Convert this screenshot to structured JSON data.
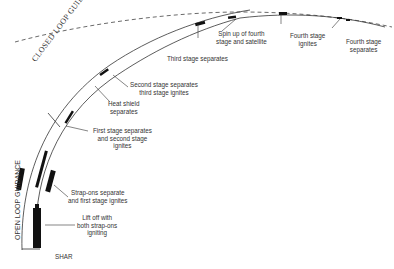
{
  "diagram": {
    "type": "launch-trajectory",
    "guidance": {
      "closed_loop": "CLOSED LOOP GUIDANCE",
      "open_loop": "OPEN LOOP GUIDANCE"
    },
    "site": "SHAR",
    "events": [
      {
        "id": "liftoff",
        "lines": [
          "Lift off with",
          "both strap-ons",
          "igniting"
        ]
      },
      {
        "id": "strapons",
        "lines": [
          "Strap-ons separate",
          "and first stage ignites"
        ]
      },
      {
        "id": "first-stage",
        "lines": [
          "First stage separates",
          "and second stage",
          "ignites"
        ]
      },
      {
        "id": "heat-shield",
        "lines": [
          "Heat shield",
          "separates"
        ]
      },
      {
        "id": "second-stage",
        "lines": [
          "Second stage separates",
          "third stage ignites"
        ]
      },
      {
        "id": "third-stage",
        "lines": [
          "Third stage separates"
        ]
      },
      {
        "id": "spin-up",
        "lines": [
          "Spin up of fourth",
          "stage and satellite"
        ]
      },
      {
        "id": "fourth-ignite",
        "lines": [
          "Fourth stage",
          "ignites"
        ]
      },
      {
        "id": "fourth-separate",
        "lines": [
          "Fourth stage",
          "separates"
        ]
      }
    ],
    "colors": {
      "line": "#333333",
      "rocket": "#111111",
      "text": "#333333"
    }
  }
}
